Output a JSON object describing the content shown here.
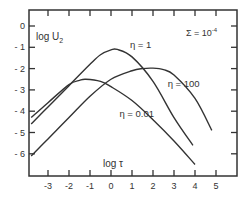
{
  "chart_data": {
    "type": "line",
    "title": "",
    "annotation": "Σ = 10⁻⁴",
    "annotation_text": "Σ = 10",
    "annotation_exp": "-4",
    "xlabel": "log τ",
    "ylabel": "log U2",
    "ylabel_main": "log U",
    "ylabel_sub": "2",
    "xlim": [
      -3.9,
      5.9
    ],
    "ylim": [
      -7.0,
      0.7
    ],
    "xticks": [
      -3,
      -2,
      -1,
      0,
      1,
      2,
      3,
      4,
      5
    ],
    "xtick_labels": [
      "-3",
      "-2",
      "-1",
      "0",
      "1",
      "2",
      "3",
      "4",
      "5"
    ],
    "yticks": [
      0,
      -1,
      -2,
      -3,
      -4,
      -5,
      -6
    ],
    "ytick_labels": [
      "0",
      "- 1",
      "- 2",
      "- 3",
      "- 4",
      "- 5",
      "- 6"
    ],
    "grid": false,
    "legend": "inline labels",
    "series": [
      {
        "name": "η = 1",
        "label": "η = 1",
        "x": [
          -3.8,
          -3.0,
          -2.0,
          -1.0,
          -0.5,
          0.0,
          0.3,
          1.0,
          2.0,
          3.0,
          3.9
        ],
        "y": [
          -4.6,
          -3.8,
          -2.8,
          -1.8,
          -1.35,
          -1.12,
          -1.1,
          -1.45,
          -2.6,
          -4.3,
          -5.6
        ]
      },
      {
        "name": "η = 100",
        "label": "η = 100",
        "x": [
          -3.8,
          -3.0,
          -2.0,
          -1.0,
          0.0,
          1.0,
          1.5,
          2.0,
          2.5,
          3.0,
          4.0,
          4.8
        ],
        "y": [
          -6.1,
          -5.3,
          -4.3,
          -3.3,
          -2.5,
          -2.1,
          -2.0,
          -1.98,
          -2.05,
          -2.3,
          -3.4,
          -4.9
        ]
      },
      {
        "name": "η = 0.01",
        "label": "η = 0.01",
        "x": [
          -3.8,
          -3.0,
          -2.0,
          -1.5,
          -1.2,
          -0.5,
          0.0,
          1.0,
          2.0,
          3.0,
          4.0
        ],
        "y": [
          -4.3,
          -3.6,
          -2.75,
          -2.55,
          -2.5,
          -2.6,
          -2.85,
          -3.5,
          -4.4,
          -5.4,
          -6.5
        ]
      }
    ],
    "label_positions": [
      {
        "series": "η = 1",
        "x": 0.9,
        "y": -1.05
      },
      {
        "series": "η = 100",
        "x": 2.7,
        "y": -2.85
      },
      {
        "series": "η = 0.01",
        "x": 0.4,
        "y": -4.25
      }
    ]
  }
}
